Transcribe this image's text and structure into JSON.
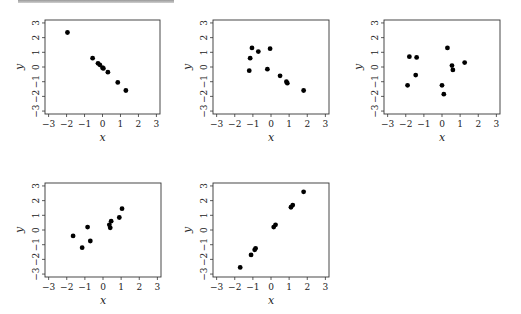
{
  "figure": {
    "header_rule": "gray-bar"
  },
  "chart_data": [
    {
      "type": "scatter",
      "panel": 1,
      "title": "",
      "xlabel": "x",
      "ylabel": "y",
      "xlim": [
        -3.2,
        3.2
      ],
      "ylim": [
        -3.2,
        3.2
      ],
      "xticks": [
        -3,
        -2,
        -1,
        0,
        1,
        2,
        3
      ],
      "yticks": [
        -3,
        -2,
        -1,
        0,
        1,
        2,
        3
      ],
      "grid": false,
      "points": [
        {
          "x": -1.95,
          "y": 2.35
        },
        {
          "x": -0.55,
          "y": 0.6
        },
        {
          "x": -0.25,
          "y": 0.25
        },
        {
          "x": -0.15,
          "y": 0.15
        },
        {
          "x": 0.0,
          "y": -0.05
        },
        {
          "x": 0.05,
          "y": -0.1
        },
        {
          "x": 0.3,
          "y": -0.35
        },
        {
          "x": 0.85,
          "y": -1.05
        },
        {
          "x": 1.3,
          "y": -1.6
        }
      ]
    },
    {
      "type": "scatter",
      "panel": 2,
      "title": "",
      "xlabel": "x",
      "ylabel": "y",
      "xlim": [
        -3.2,
        3.2
      ],
      "ylim": [
        -3.2,
        3.2
      ],
      "xticks": [
        -3,
        -2,
        -1,
        0,
        1,
        2,
        3
      ],
      "yticks": [
        -3,
        -2,
        -1,
        0,
        1,
        2,
        3
      ],
      "grid": false,
      "points": [
        {
          "x": -1.05,
          "y": 1.3
        },
        {
          "x": -0.7,
          "y": 1.05
        },
        {
          "x": -0.05,
          "y": 1.25
        },
        {
          "x": -1.15,
          "y": 0.6
        },
        {
          "x": -1.2,
          "y": -0.25
        },
        {
          "x": -0.2,
          "y": -0.15
        },
        {
          "x": 0.5,
          "y": -0.6
        },
        {
          "x": 0.85,
          "y": -1.0
        },
        {
          "x": 0.9,
          "y": -1.1
        },
        {
          "x": 1.8,
          "y": -1.6
        }
      ]
    },
    {
      "type": "scatter",
      "panel": 3,
      "title": "",
      "xlabel": "x",
      "ylabel": "y",
      "xlim": [
        -3.2,
        3.2
      ],
      "ylim": [
        -3.2,
        3.2
      ],
      "xticks": [
        -3,
        -2,
        -1,
        0,
        1,
        2,
        3
      ],
      "yticks": [
        -3,
        -2,
        -1,
        0,
        1,
        2,
        3
      ],
      "grid": false,
      "points": [
        {
          "x": 0.3,
          "y": 1.3
        },
        {
          "x": -1.8,
          "y": 0.7
        },
        {
          "x": -1.4,
          "y": 0.65
        },
        {
          "x": 0.55,
          "y": 0.1
        },
        {
          "x": 0.6,
          "y": -0.2
        },
        {
          "x": 1.25,
          "y": 0.3
        },
        {
          "x": -1.45,
          "y": -0.55
        },
        {
          "x": -1.9,
          "y": -1.25
        },
        {
          "x": 0.0,
          "y": -1.25
        },
        {
          "x": 0.1,
          "y": -1.85
        }
      ]
    },
    {
      "type": "scatter",
      "panel": 4,
      "title": "",
      "xlabel": "x",
      "ylabel": "y",
      "xlim": [
        -3.2,
        3.2
      ],
      "ylim": [
        -3.2,
        3.2
      ],
      "xticks": [
        -3,
        -2,
        -1,
        0,
        1,
        2,
        3
      ],
      "yticks": [
        -3,
        -2,
        -1,
        0,
        1,
        2,
        3
      ],
      "grid": false,
      "points": [
        {
          "x": -1.65,
          "y": -0.4
        },
        {
          "x": -1.15,
          "y": -1.2
        },
        {
          "x": -0.85,
          "y": 0.2
        },
        {
          "x": -0.7,
          "y": -0.75
        },
        {
          "x": 0.35,
          "y": 0.35
        },
        {
          "x": 0.4,
          "y": 0.15
        },
        {
          "x": 0.45,
          "y": 0.6
        },
        {
          "x": 0.9,
          "y": 0.85
        },
        {
          "x": 1.05,
          "y": 1.45
        }
      ]
    },
    {
      "type": "scatter",
      "panel": 5,
      "title": "",
      "xlabel": "x",
      "ylabel": "y",
      "xlim": [
        -3.2,
        3.2
      ],
      "ylim": [
        -3.2,
        3.2
      ],
      "xticks": [
        -3,
        -2,
        -1,
        0,
        1,
        2,
        3
      ],
      "yticks": [
        -3,
        -2,
        -1,
        0,
        1,
        2,
        3
      ],
      "grid": false,
      "points": [
        {
          "x": -1.7,
          "y": -2.55
        },
        {
          "x": -1.1,
          "y": -1.7
        },
        {
          "x": -0.9,
          "y": -1.35
        },
        {
          "x": -0.85,
          "y": -1.25
        },
        {
          "x": 0.15,
          "y": 0.2
        },
        {
          "x": 0.25,
          "y": 0.35
        },
        {
          "x": 1.1,
          "y": 1.55
        },
        {
          "x": 1.2,
          "y": 1.7
        },
        {
          "x": 1.8,
          "y": 2.6
        }
      ]
    }
  ],
  "layout": {
    "panels": [
      {
        "left": 45,
        "top": 20,
        "width": 115,
        "height": 94
      },
      {
        "left": 213,
        "top": 20,
        "width": 116,
        "height": 94
      },
      {
        "left": 384,
        "top": 20,
        "width": 116,
        "height": 94
      },
      {
        "left": 45,
        "top": 183,
        "width": 116,
        "height": 94
      },
      {
        "left": 213,
        "top": 183,
        "width": 116,
        "height": 94
      }
    ]
  }
}
